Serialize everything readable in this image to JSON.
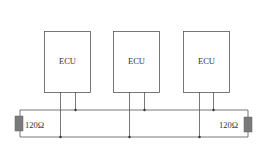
{
  "diagram": {
    "type": "CAN bus topology",
    "nodes": [
      {
        "label": "ECU"
      },
      {
        "label": "ECU"
      },
      {
        "label": "ECU"
      }
    ],
    "terminators": [
      {
        "label": "120Ω",
        "side": "left"
      },
      {
        "label": "120Ω",
        "side": "right"
      }
    ],
    "colors": {
      "line": "#555555",
      "box_border": "#555555",
      "resistor_fill": "#7a7a7a"
    }
  }
}
